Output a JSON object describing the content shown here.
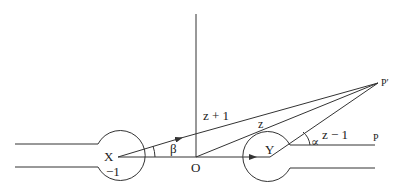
{
  "diagram": {
    "type": "geometry",
    "colors": {
      "stroke": "#333333",
      "background": "#ffffff"
    },
    "labels": {
      "point_x": "X",
      "point_x_value": "−1",
      "point_o": "O",
      "point_y": "Y",
      "point_p": "P",
      "point_p_prime": "P′",
      "vector_z_plus_1": "z + 1",
      "vector_z": "z",
      "vector_z_minus_1": "z − 1",
      "angle_beta": "β",
      "angle_alpha": "∝"
    }
  }
}
